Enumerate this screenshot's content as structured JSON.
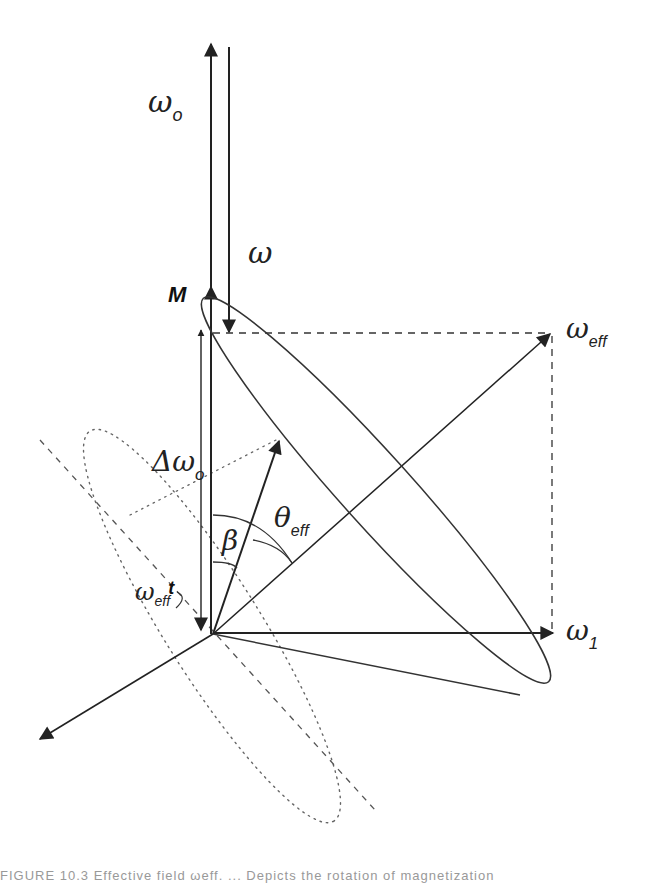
{
  "figure": {
    "labels": {
      "omega_o": {
        "main": "ω",
        "sub": "o"
      },
      "omega": {
        "main": "ω"
      },
      "M": {
        "main": "M"
      },
      "omega_eff": {
        "main": "ω",
        "sub": "eff"
      },
      "delta_omega_o": {
        "main": "Δω",
        "sub": "o"
      },
      "theta_eff": {
        "main": "θ",
        "sub": "eff"
      },
      "beta": {
        "main": "β"
      },
      "omega_eff_t": {
        "main": "ω",
        "sub": "eff",
        "suffix": "t"
      },
      "omega_1": {
        "main": "ω",
        "sub": "1"
      }
    },
    "colors": {
      "line": "#333333",
      "dotted": "#666666",
      "background": "#ffffff"
    }
  },
  "caption": {
    "text": "FIGURE 10.3   Effective field ωeff. ... Depicts the rotation of magnetization"
  }
}
